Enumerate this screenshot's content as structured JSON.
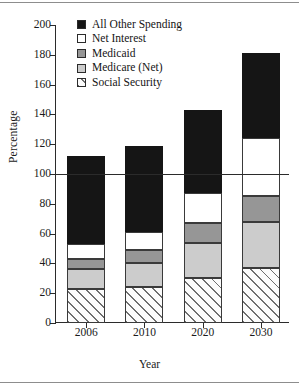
{
  "chart_data": {
    "type": "bar",
    "subtype": "stacked",
    "title": "",
    "xlabel": "Year",
    "ylabel": "Percentage",
    "categories": [
      "2006",
      "2010",
      "2020",
      "2030"
    ],
    "ylim": [
      0,
      200
    ],
    "yticks": [
      0,
      20,
      40,
      60,
      80,
      100,
      120,
      140,
      160,
      180,
      200
    ],
    "ytick_labels": [
      "0",
      "20",
      "40",
      "60",
      "80",
      "100",
      "120",
      "140",
      "160",
      "180",
      "200"
    ],
    "grid": false,
    "legend_position": "top-center",
    "reference_line": {
      "value": 100,
      "label": "100"
    },
    "stack_order_bottom_to_top": [
      "Social Security",
      "Medicare (Net)",
      "Medicaid",
      "Net Interest",
      "All Other Spending"
    ],
    "series": [
      {
        "name": "Social Security",
        "swatch": "hatch",
        "values": [
          23,
          24,
          30,
          37
        ]
      },
      {
        "name": "Medicare (Net)",
        "swatch": "light-gray",
        "values": [
          13,
          16,
          24,
          31
        ]
      },
      {
        "name": "Medicaid",
        "swatch": "dark-gray",
        "values": [
          7,
          9,
          13,
          17
        ]
      },
      {
        "name": "Net Interest",
        "swatch": "white",
        "values": [
          10,
          12,
          20,
          39
        ]
      },
      {
        "name": "All Other Spending",
        "swatch": "black",
        "values": [
          59,
          58,
          56,
          57
        ]
      }
    ],
    "totals": [
      112,
      119,
      143,
      181
    ]
  },
  "legend": {
    "items": [
      {
        "label": "All Other Spending",
        "swatch": "black"
      },
      {
        "label": "Net Interest",
        "swatch": "white"
      },
      {
        "label": "Medicaid",
        "swatch": "dark-gray"
      },
      {
        "label": "Medicare (Net)",
        "swatch": "light-gray"
      },
      {
        "label": "Social Security",
        "swatch": "hatch"
      }
    ]
  },
  "colors": {
    "black": "#151515",
    "white": "#ffffff",
    "dark_gray": "#969696",
    "light_gray": "#cccccc",
    "hatch_line": "#6e6e6e",
    "axis": "#2b2b2b",
    "text": "#1a1a1a",
    "rule": "#8d8d8d"
  }
}
